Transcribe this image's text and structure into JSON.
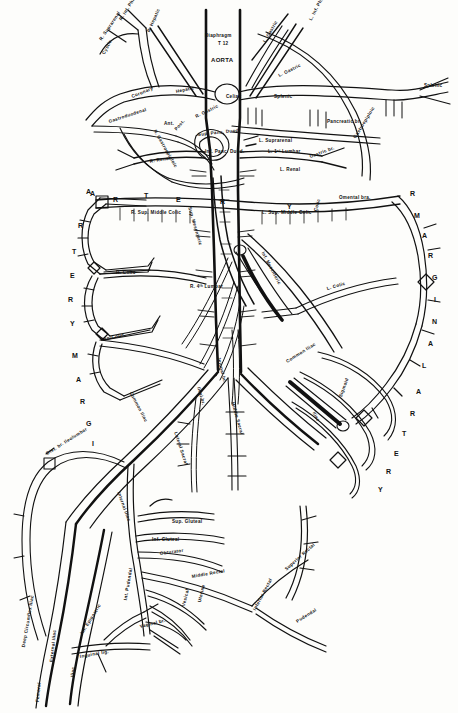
{
  "figure": {
    "title": "AORTA",
    "subtitle": "Diaphragm T 12",
    "type": "anatomical-line-diagram"
  },
  "labels": [
    {
      "id": "diaphragm",
      "text": "Diaphragm",
      "x": 205,
      "y": 34,
      "rot": 0,
      "size": "tiny"
    },
    {
      "id": "t12",
      "text": "T 12",
      "x": 218,
      "y": 42,
      "rot": 0,
      "size": "tiny"
    },
    {
      "id": "aorta",
      "text": "AORTA",
      "x": 211,
      "y": 57,
      "rot": 0,
      "size": "med"
    },
    {
      "id": "r-inf-phrenic",
      "text": "R. Inf. Phrenic",
      "x": 121,
      "y": 18,
      "rot": -58,
      "size": "tiny"
    },
    {
      "id": "r-suprarenal",
      "text": "R. Suprarenal",
      "x": 101,
      "y": 38,
      "rot": -56,
      "size": "tiny"
    },
    {
      "id": "cystic",
      "text": "Cystic",
      "x": 104,
      "y": 52,
      "rot": -62,
      "size": "tiny"
    },
    {
      "id": "r-hepatic",
      "text": "R. Hepatic",
      "x": 149,
      "y": 30,
      "rot": -66,
      "size": "tiny"
    },
    {
      "id": "r-gastric",
      "text": "R. Gastric",
      "x": 196,
      "y": 115,
      "rot": -26,
      "size": "tiny"
    },
    {
      "id": "l-inf-phrenic",
      "text": "L. Inf. Phrenic",
      "x": 311,
      "y": 18,
      "rot": -62,
      "size": "tiny"
    },
    {
      "id": "l-gastric",
      "text": "L. Gastric",
      "x": 265,
      "y": 40,
      "rot": -60,
      "size": "tiny"
    },
    {
      "id": "l-gastric2",
      "text": "L. Gastric",
      "x": 279,
      "y": 74,
      "rot": -26,
      "size": "tiny"
    },
    {
      "id": "coronary",
      "text": "Coronary",
      "x": 132,
      "y": 95,
      "rot": -22,
      "size": "tiny"
    },
    {
      "id": "hepatic",
      "text": "Hepatic",
      "x": 176,
      "y": 90,
      "rot": -12,
      "size": "tiny"
    },
    {
      "id": "celiac",
      "text": "Celiac",
      "x": 226,
      "y": 95,
      "rot": 0,
      "size": "tiny"
    },
    {
      "id": "splenic",
      "text": "Splenic",
      "x": 274,
      "y": 95,
      "rot": 0,
      "size": "tiny"
    },
    {
      "id": "splenic-right",
      "text": "Splenic",
      "x": 424,
      "y": 84,
      "rot": 0,
      "size": "tiny"
    },
    {
      "id": "pancreatic-br",
      "text": "Pancreatic br.",
      "x": 327,
      "y": 120,
      "rot": 0,
      "size": "tiny"
    },
    {
      "id": "suprarenal-l",
      "text": "L. Suprarenal",
      "x": 259,
      "y": 139,
      "rot": 0,
      "size": "tiny"
    },
    {
      "id": "l-first-lumbar",
      "text": "L. 1ˢᵗ Lumbar",
      "x": 268,
      "y": 150,
      "rot": 0,
      "size": "tiny"
    },
    {
      "id": "gastroepiploic",
      "text": "Gastroepiploic",
      "x": 355,
      "y": 136,
      "rot": -58,
      "size": "tiny"
    },
    {
      "id": "gastric-br",
      "text": "Gastric br.",
      "x": 310,
      "y": 155,
      "rot": -20,
      "size": "tiny"
    },
    {
      "id": "gastroduodenal",
      "text": "Gastroduodenal",
      "x": 109,
      "y": 120,
      "rot": -18,
      "size": "tiny"
    },
    {
      "id": "ant",
      "text": "Ant.",
      "x": 164,
      "y": 122,
      "rot": 0,
      "size": "tiny"
    },
    {
      "id": "post",
      "text": "Post.",
      "x": 176,
      "y": 128,
      "rot": -48,
      "size": "tiny"
    },
    {
      "id": "sup-pancduo",
      "text": "Sup. Panc. Duod.",
      "x": 198,
      "y": 133,
      "rot": -6,
      "size": "tiny"
    },
    {
      "id": "right-gastroep",
      "text": "R. Gastroepiploic",
      "x": 154,
      "y": 128,
      "rot": 60,
      "size": "tiny"
    },
    {
      "id": "inf-panc-duod",
      "text": "Inf. Panc. Duod.",
      "x": 205,
      "y": 150,
      "rot": 0,
      "size": "tiny"
    },
    {
      "id": "sup-mesenteric",
      "text": "Sup. Mesenteric",
      "x": 189,
      "y": 205,
      "rot": 74,
      "size": "tiny"
    },
    {
      "id": "r-renal",
      "text": "R. Renal",
      "x": 150,
      "y": 160,
      "rot": -10,
      "size": "tiny"
    },
    {
      "id": "l-renal",
      "text": "L. Renal",
      "x": 280,
      "y": 168,
      "rot": 0,
      "size": "tiny"
    },
    {
      "id": "r-sup-middle-colic",
      "text": "R. Sup. Middle Colic",
      "x": 131,
      "y": 211,
      "rot": 0,
      "size": "tiny"
    },
    {
      "id": "l-sup-middle-colic",
      "text": "L. Sup. Middle Colic",
      "x": 262,
      "y": 211,
      "rot": 0,
      "size": "tiny"
    },
    {
      "id": "colic-mid",
      "text": "Colic",
      "x": 316,
      "y": 209,
      "rot": -74,
      "size": "tiny"
    },
    {
      "id": "omental-bra",
      "text": "Omental bra.",
      "x": 339,
      "y": 196,
      "rot": 0,
      "size": "tiny"
    },
    {
      "id": "r-colic",
      "text": "R. Colic",
      "x": 116,
      "y": 271,
      "rot": 0,
      "size": "tiny"
    },
    {
      "id": "l-colic",
      "text": "L. Colic",
      "x": 327,
      "y": 287,
      "rot": -16,
      "size": "tiny"
    },
    {
      "id": "ileo-colic",
      "text": "Ileo-Colic",
      "x": 101,
      "y": 338,
      "rot": -12,
      "size": "tiny"
    },
    {
      "id": "r-4th-lumbar",
      "text": "R. 4ᵗʰ Lumbar",
      "x": 190,
      "y": 285,
      "rot": 0,
      "size": "tiny"
    },
    {
      "id": "inf-mesenteric",
      "text": "Inf. Mesenteric",
      "x": 262,
      "y": 250,
      "rot": 62,
      "size": "tiny"
    },
    {
      "id": "ileal-br",
      "text": "Ileal br.",
      "x": 198,
      "y": 385,
      "rot": 74,
      "size": "tiny"
    },
    {
      "id": "jejunal-br",
      "text": "Jejunal br.",
      "x": 218,
      "y": 355,
      "rot": 76,
      "size": "tiny"
    },
    {
      "id": "common-iliac-l",
      "text": "Common Iliac",
      "x": 130,
      "y": 390,
      "rot": 62,
      "size": "tiny"
    },
    {
      "id": "common-iliac-r",
      "text": "Common Iliac",
      "x": 287,
      "y": 360,
      "rot": -32,
      "size": "tiny"
    },
    {
      "id": "lateral-sacral",
      "text": "Lateral Sacral",
      "x": 175,
      "y": 430,
      "rot": 72,
      "size": "tiny"
    },
    {
      "id": "middle-sacral",
      "text": "Middle Sacral",
      "x": 232,
      "y": 400,
      "rot": 74,
      "size": "tiny"
    },
    {
      "id": "iliac-sig",
      "text": "Iliac",
      "x": 313,
      "y": 410,
      "rot": 62,
      "size": "tiny"
    },
    {
      "id": "sigmoid-arc",
      "text": "Sigmoid",
      "x": 341,
      "y": 395,
      "rot": -70,
      "size": "tiny"
    },
    {
      "id": "int-iliac",
      "text": "Internal Iliac",
      "x": 118,
      "y": 490,
      "rot": 70,
      "size": "tiny"
    },
    {
      "id": "dist-br-ileolumbar",
      "text": "Dist. br. Ileolumbar",
      "x": 47,
      "y": 452,
      "rot": -32,
      "size": "tiny"
    },
    {
      "id": "sup-gluteal",
      "text": "Sup. Gluteal",
      "x": 172,
      "y": 520,
      "rot": 0,
      "size": "tiny"
    },
    {
      "id": "inf-gluteal",
      "text": "Inf. Gluteal",
      "x": 152,
      "y": 538,
      "rot": 0,
      "size": "tiny"
    },
    {
      "id": "obturator",
      "text": "Obturator",
      "x": 160,
      "y": 552,
      "rot": -8,
      "size": "tiny"
    },
    {
      "id": "middle-rectal",
      "text": "Middle Rectal",
      "x": 192,
      "y": 575,
      "rot": -10,
      "size": "tiny"
    },
    {
      "id": "superior-rectal",
      "text": "Superior Rectal",
      "x": 286,
      "y": 568,
      "rot": -42,
      "size": "tiny"
    },
    {
      "id": "inferior-rectal",
      "text": "Inferior Rectal",
      "x": 255,
      "y": 608,
      "rot": -62,
      "size": "tiny"
    },
    {
      "id": "uterine",
      "text": "Uterine",
      "x": 200,
      "y": 600,
      "rot": -76,
      "size": "tiny"
    },
    {
      "id": "vesical",
      "text": "Vesical",
      "x": 184,
      "y": 604,
      "rot": -76,
      "size": "tiny"
    },
    {
      "id": "pudendal",
      "text": "Pudendal",
      "x": 297,
      "y": 620,
      "rot": -32,
      "size": "tiny"
    },
    {
      "id": "int-pudendal",
      "text": "Int. Pudendal",
      "x": 126,
      "y": 598,
      "rot": -80,
      "size": "tiny"
    },
    {
      "id": "vaginal-br",
      "text": "Vaginal br.",
      "x": 140,
      "y": 625,
      "rot": -14,
      "size": "tiny"
    },
    {
      "id": "ext-iliac",
      "text": "External Iliac",
      "x": 52,
      "y": 660,
      "rot": -84,
      "size": "tiny"
    },
    {
      "id": "femoral",
      "text": "Femoral",
      "x": 38,
      "y": 700,
      "rot": -84,
      "size": "tiny"
    },
    {
      "id": "deep-circ-iliac",
      "text": "Deep Circumflex Iliac",
      "x": 24,
      "y": 645,
      "rot": -80,
      "size": "tiny"
    },
    {
      "id": "inf-epigastric",
      "text": "Inf. Epigastric",
      "x": 82,
      "y": 632,
      "rot": -58,
      "size": "tiny"
    },
    {
      "id": "inguinal-lig",
      "text": "Inguinal lig.",
      "x": 80,
      "y": 655,
      "rot": -10,
      "size": "tiny"
    },
    {
      "id": "iliac-top-right",
      "text": "Iliac",
      "x": 73,
      "y": 675,
      "rot": -84,
      "size": "tiny"
    }
  ],
  "spine_letters_left": [
    {
      "ch": "A",
      "x": 86,
      "y": 188
    },
    {
      "ch": "R",
      "x": 78,
      "y": 222
    },
    {
      "ch": "T",
      "x": 72,
      "y": 248
    },
    {
      "ch": "E",
      "x": 70,
      "y": 272
    },
    {
      "ch": "R",
      "x": 68,
      "y": 296
    },
    {
      "ch": "Y",
      "x": 70,
      "y": 320
    },
    {
      "ch": "M",
      "x": 72,
      "y": 352
    },
    {
      "ch": "A",
      "x": 76,
      "y": 376
    },
    {
      "ch": "R",
      "x": 80,
      "y": 398
    },
    {
      "ch": "G",
      "x": 86,
      "y": 420
    },
    {
      "ch": "I",
      "x": 92,
      "y": 440
    }
  ],
  "spine_letters_top": [
    {
      "ch": "A",
      "x": 90,
      "y": 190
    },
    {
      "ch": "R",
      "x": 113,
      "y": 196
    },
    {
      "ch": "T",
      "x": 144,
      "y": 192
    },
    {
      "ch": "E",
      "x": 176,
      "y": 196
    },
    {
      "ch": "R",
      "x": 220,
      "y": 198
    },
    {
      "ch": "Y",
      "x": 287,
      "y": 203
    }
  ],
  "spine_letters_right": [
    {
      "ch": "R",
      "x": 410,
      "y": 190
    },
    {
      "ch": "M",
      "x": 414,
      "y": 212
    },
    {
      "ch": "A",
      "x": 422,
      "y": 232
    },
    {
      "ch": "R",
      "x": 428,
      "y": 252
    },
    {
      "ch": "G",
      "x": 432,
      "y": 274
    },
    {
      "ch": "I",
      "x": 434,
      "y": 296
    },
    {
      "ch": "N",
      "x": 432,
      "y": 318
    },
    {
      "ch": "A",
      "x": 428,
      "y": 340
    },
    {
      "ch": "L",
      "x": 422,
      "y": 362
    },
    {
      "ch": "A",
      "x": 416,
      "y": 388
    },
    {
      "ch": "R",
      "x": 410,
      "y": 410
    },
    {
      "ch": "T",
      "x": 402,
      "y": 430
    },
    {
      "ch": "E",
      "x": 394,
      "y": 450
    },
    {
      "ch": "R",
      "x": 386,
      "y": 468
    },
    {
      "ch": "Y",
      "x": 378,
      "y": 486
    }
  ],
  "colors": {
    "ink": "#111111",
    "paper": "#fdfdfb"
  }
}
